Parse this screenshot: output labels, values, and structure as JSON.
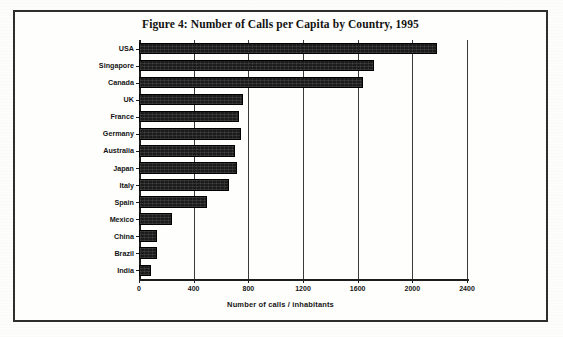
{
  "figure": {
    "title": "Figure 4: Number of Calls per Capita by Country, 1995"
  },
  "chart_data": {
    "type": "bar",
    "orientation": "horizontal",
    "title": "Figure 4: Number of Calls per Capita by Country, 1995",
    "xlabel": "Number of calls / inhabitants",
    "ylabel": "",
    "xlim": [
      0,
      2400
    ],
    "xticks": [
      0,
      400,
      800,
      1200,
      1600,
      2000,
      2400
    ],
    "xtick_labels": [
      "0",
      "400",
      "800",
      "1200",
      "1600",
      "2000",
      "2400"
    ],
    "grid": "vertical",
    "legend": "none",
    "bar_color": "#1b1b1b",
    "categories": [
      "USA",
      "Singapore",
      "Canada",
      "UK",
      "France",
      "Germany",
      "Australia",
      "Japan",
      "Italy",
      "Spain",
      "Mexico",
      "China",
      "Brazil",
      "India"
    ],
    "values": [
      2180,
      1720,
      1640,
      760,
      730,
      745,
      705,
      720,
      655,
      500,
      240,
      130,
      135,
      90
    ]
  }
}
